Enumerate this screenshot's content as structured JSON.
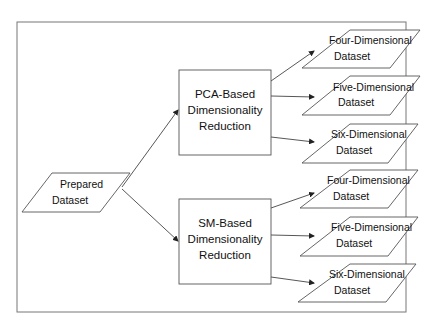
{
  "diagram": {
    "type": "flowchart",
    "input": {
      "line1": "Prepared",
      "line2": "Dataset"
    },
    "methods": [
      {
        "line1": "PCA-Based",
        "line2": "Dimensionality",
        "line3": "Reduction"
      },
      {
        "line1": "SM-Based",
        "line2": "Dimensionality",
        "line3": "Reduction"
      }
    ],
    "outputs": [
      {
        "line1": "Four-Dimensional",
        "line2": "Dataset"
      },
      {
        "line1": "Five-Dimensional",
        "line2": "Dataset"
      },
      {
        "line1": "Six-Dimensional",
        "line2": "Dataset"
      },
      {
        "line1": "Four-Dimensional",
        "line2": "Dataset"
      },
      {
        "line1": "Five-Dimensional",
        "line2": "Dataset"
      },
      {
        "line1": "Six-Dimensional",
        "line2": "Dataset"
      }
    ],
    "edges": [
      {
        "from": "Prepared Dataset",
        "to": "PCA-Based Dimensionality Reduction"
      },
      {
        "from": "Prepared Dataset",
        "to": "SM-Based Dimensionality Reduction"
      },
      {
        "from": "PCA-Based Dimensionality Reduction",
        "to": "Four-Dimensional Dataset"
      },
      {
        "from": "PCA-Based Dimensionality Reduction",
        "to": "Five-Dimensional Dataset"
      },
      {
        "from": "PCA-Based Dimensionality Reduction",
        "to": "Six-Dimensional Dataset"
      },
      {
        "from": "SM-Based Dimensionality Reduction",
        "to": "Four-Dimensional Dataset"
      },
      {
        "from": "SM-Based Dimensionality Reduction",
        "to": "Five-Dimensional Dataset"
      },
      {
        "from": "SM-Based Dimensionality Reduction",
        "to": "Six-Dimensional Dataset"
      }
    ],
    "colors": {
      "stroke": "#555555",
      "text": "#111111",
      "background": "#ffffff"
    }
  }
}
